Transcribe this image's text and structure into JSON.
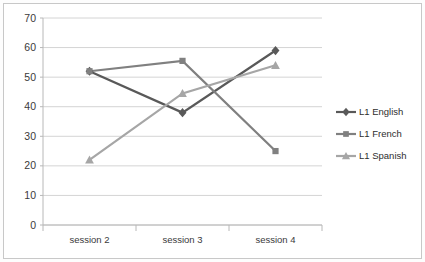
{
  "chart_data": {
    "type": "line",
    "title": "",
    "subtitle": "",
    "xlabel": "",
    "ylabel": "",
    "categories": [
      "session 2",
      "session 3",
      "session 4"
    ],
    "ylim": [
      0,
      70
    ],
    "ytick_step": 10,
    "yticks": [
      "0",
      "10",
      "20",
      "30",
      "40",
      "50",
      "60",
      "70"
    ],
    "grid": true,
    "legend_position": "right",
    "series": [
      {
        "name": "L1 English",
        "values": [
          52,
          38,
          59
        ],
        "color": "#595959",
        "marker": "diamond"
      },
      {
        "name": "L1 French",
        "values": [
          52,
          55.5,
          25
        ],
        "color": "#808080",
        "marker": "square"
      },
      {
        "name": "L1 Spanish",
        "values": [
          22,
          44.5,
          54
        ],
        "color": "#a6a6a6",
        "marker": "triangle"
      }
    ]
  },
  "legend": {
    "items": [
      {
        "label": "L1 English"
      },
      {
        "label": "L1 French"
      },
      {
        "label": "L1 Spanish"
      }
    ]
  },
  "axis": {
    "y_labels": [
      "70",
      "60",
      "50",
      "40",
      "30",
      "20",
      "10",
      "0"
    ],
    "x_labels": [
      "session 2",
      "session 3",
      "session 4"
    ]
  }
}
